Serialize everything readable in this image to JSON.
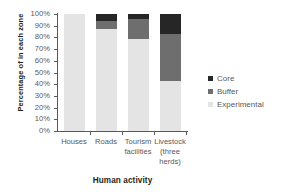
{
  "chart_data": {
    "type": "bar",
    "subtype": "stacked-100-percent",
    "title": "",
    "xlabel": "Human activity",
    "ylabel": "Percentage of in each zone",
    "categories": [
      "Houses",
      "Roads",
      "Tourism facilities",
      "Livestock (three herds)"
    ],
    "category_lines": [
      [
        "Houses"
      ],
      [
        "Roads"
      ],
      [
        "Tourism",
        "facilities"
      ],
      [
        "Livestock",
        "(three",
        "herds)"
      ]
    ],
    "series": [
      {
        "name": "Experimental",
        "color": "#e4e4e4",
        "values": [
          100,
          87,
          79,
          43
        ]
      },
      {
        "name": "Buffer",
        "color": "#6e6e6e",
        "values": [
          0,
          7,
          17,
          40
        ]
      },
      {
        "name": "Core",
        "color": "#262626",
        "values": [
          0,
          6,
          4,
          17
        ]
      }
    ],
    "stack_order_bottom_to_top": [
      "Experimental",
      "Buffer",
      "Core"
    ],
    "ylim": [
      0,
      100
    ],
    "ytick_values": [
      0,
      10,
      20,
      30,
      40,
      50,
      60,
      70,
      80,
      90,
      100
    ],
    "ytick_labels": [
      "0%",
      "10%",
      "20%",
      "30%",
      "40%",
      "50%",
      "60%",
      "70%",
      "80%",
      "90%",
      "100%"
    ],
    "grid": false,
    "legend_position": "right",
    "legend_entries": [
      {
        "label": "Core",
        "color": "#262626"
      },
      {
        "label": "Buffer",
        "color": "#6e6e6e"
      },
      {
        "label": "Experimental",
        "color": "#e4e4e4"
      }
    ]
  },
  "colors": {
    "core": "#262626",
    "buffer": "#6e6e6e",
    "experimental": "#e4e4e4",
    "axis": "#58595b",
    "title_text": "#231f20",
    "background": "#ffffff"
  }
}
